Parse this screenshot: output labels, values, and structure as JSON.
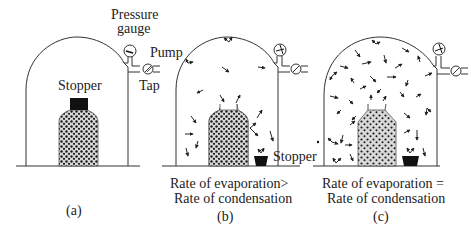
{
  "figure": {
    "panels": [
      {
        "id": "a",
        "caption": "(a)",
        "labels": {
          "stopper": "Stopper",
          "pressure_gauge_line1": "Pressure",
          "pressure_gauge_line2": "gauge",
          "pump": "Pump",
          "tap": "Tap"
        },
        "state": "sealed bottle, no vapour"
      },
      {
        "id": "b",
        "caption": "(b)",
        "condition_line1": "Rate of evaporation>",
        "condition_line2": "Rate of condensation",
        "labels": {
          "stopper": "Stopper"
        },
        "state": "bottle open, few vapour molecules"
      },
      {
        "id": "c",
        "caption": "(c)",
        "condition_line1": "Rate of evaporation =",
        "condition_line2": "Rate of condensation",
        "state": "bottle open, many vapour molecules (equilibrium)"
      }
    ],
    "colors": {
      "line": "#333333",
      "liquid_fill": "#d9d9d9",
      "molecule": "#1a1a1a",
      "stopper": "#111111",
      "text": "#222222"
    }
  }
}
